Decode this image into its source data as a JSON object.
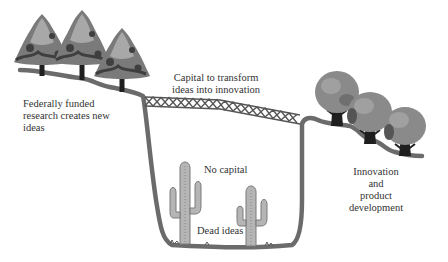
{
  "diagram": {
    "labels": {
      "left_research": [
        "Federally funded",
        "research creates new",
        "ideas"
      ],
      "bridge": [
        "Capital to transform",
        "ideas into innovation"
      ],
      "pit_top": "No capital",
      "pit_bottom": "Dead ideas",
      "right_innovation": [
        "Innovation",
        "and",
        "product",
        "development"
      ]
    },
    "elements": {
      "left_trees": 3,
      "right_trees": 3,
      "cacti": 2,
      "bridge": "lattice truss spanning the chasm"
    },
    "colors": {
      "ground": "#6b6b6b",
      "tree_dark": "#3f3f3f",
      "tree_mid": "#7a7a7a",
      "tree_light": "#a8a8a8",
      "trunk": "#1f1f1f",
      "bridge": "#555555",
      "cactus": "#9a9a9a",
      "text": "#333333"
    }
  }
}
